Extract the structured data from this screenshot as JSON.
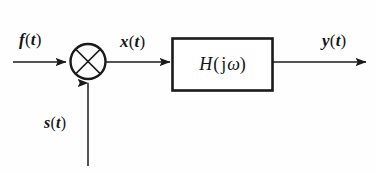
{
  "diagram": {
    "type": "block-diagram",
    "canvas": {
      "width": 376,
      "height": 173,
      "background": "#fefefe"
    },
    "stroke_color": "#1a1a1a",
    "text_color": "#141414",
    "labels": {
      "input_signal": "f(t)",
      "input_var": "f",
      "mixer_output": "x(t)",
      "mixer_output_var": "x",
      "carrier_signal": "s(t)",
      "carrier_var": "s",
      "output_signal": "y(t)",
      "output_var": "y",
      "time_var": "t",
      "left_paren": "(",
      "right_paren": ")"
    },
    "block": {
      "name": "transfer-function-block",
      "label": "H(jω)",
      "function_symbol": "H",
      "imaginary_symbol": "j",
      "omega_symbol": "ω",
      "x": 172,
      "y": 38,
      "width": 101,
      "height": 53
    },
    "multiplier": {
      "name": "multiplier-node",
      "symbol": "×",
      "center_x": 88,
      "center_y": 61,
      "radius": 18
    },
    "connections": [
      {
        "name": "input-arrow",
        "from": "f(t)",
        "to": "multiplier",
        "direction": "right"
      },
      {
        "name": "carrier-arrow",
        "from": "s(t)",
        "to": "multiplier",
        "direction": "up"
      },
      {
        "name": "mixer-arrow",
        "from": "multiplier",
        "to": "H(jω)",
        "direction": "right"
      },
      {
        "name": "output-arrow",
        "from": "H(jω)",
        "to": "y(t)",
        "direction": "right"
      }
    ]
  }
}
